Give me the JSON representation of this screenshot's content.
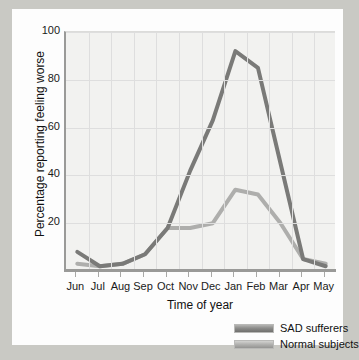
{
  "chart_data": {
    "type": "line",
    "title": "",
    "xlabel": "Time of year",
    "ylabel": "Percentage reporting feeling worse",
    "categories": [
      "Jun",
      "Jul",
      "Aug",
      "Sep",
      "Oct",
      "Nov",
      "Dec",
      "Jan",
      "Feb",
      "Mar",
      "Apr",
      "May"
    ],
    "ylim": [
      0,
      100
    ],
    "yticks": [
      20,
      40,
      60,
      80,
      100
    ],
    "ytick_labels": [
      "20",
      "40",
      "60",
      "80",
      "100"
    ],
    "grid": true,
    "legend_position": "bottom-right",
    "series": [
      {
        "name": "SAD sufferers",
        "color": "#7a7a78",
        "values": [
          8,
          2,
          3,
          7,
          18,
          42,
          63,
          92,
          85,
          45,
          5,
          2
        ]
      },
      {
        "name": "Normal subjects",
        "color": "#aeaeac",
        "values": [
          3,
          2,
          3,
          7,
          18,
          18,
          20,
          34,
          32,
          20,
          5,
          3
        ]
      }
    ]
  },
  "legend": {
    "items": [
      {
        "label": "SAD sufferers"
      },
      {
        "label": "Normal subjects"
      }
    ]
  }
}
